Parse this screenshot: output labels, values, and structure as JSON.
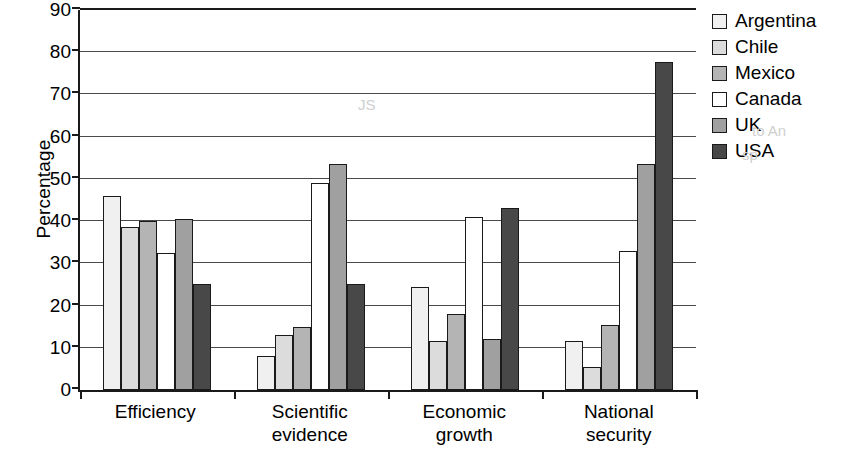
{
  "chart_data": {
    "type": "bar",
    "title": "",
    "xlabel": "",
    "ylabel": "Percentage",
    "ylim": [
      0,
      90
    ],
    "ytick_step": 10,
    "yticks": [
      0,
      10,
      20,
      30,
      40,
      50,
      60,
      70,
      80,
      90
    ],
    "grid": true,
    "legend_position": "right",
    "categories": [
      "Efficiency",
      "Scientific evidence",
      "Economic growth",
      "National security"
    ],
    "category_lines": [
      [
        "Efficiency"
      ],
      [
        "Scientific",
        "evidence"
      ],
      [
        "Economic",
        "growth"
      ],
      [
        "National",
        "security"
      ]
    ],
    "series": [
      {
        "name": "Argentina",
        "color": "#f0f0f0",
        "values": [
          46,
          8,
          24.5,
          11.5
        ]
      },
      {
        "name": "Chile",
        "color": "#dcdcdc",
        "values": [
          38.5,
          13,
          11.5,
          5.5
        ]
      },
      {
        "name": "Mexico",
        "color": "#b4b4b4",
        "values": [
          40,
          15,
          18,
          15.5
        ]
      },
      {
        "name": "Canada",
        "color": "#ffffff",
        "values": [
          32.5,
          49,
          41,
          33
        ]
      },
      {
        "name": "UK",
        "color": "#a0a0a0",
        "values": [
          40.5,
          53.5,
          12,
          53.5
        ]
      },
      {
        "name": "USA",
        "color": "#484848",
        "values": [
          25,
          25,
          43,
          77.8
        ]
      }
    ]
  },
  "axis": {
    "y_title": "Percentage"
  },
  "colors": {
    "axis": "#1a1a1a",
    "grid": "#4a4a4a",
    "background": "#ffffff"
  }
}
